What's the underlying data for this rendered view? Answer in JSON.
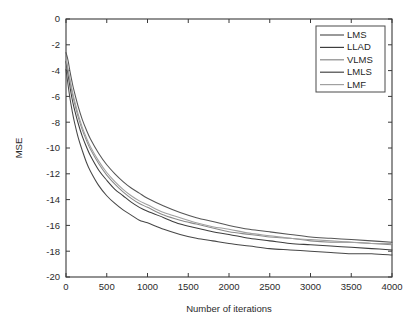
{
  "chart_data": {
    "type": "line",
    "title": "",
    "xlabel": "Number of iterations",
    "ylabel": "MSE",
    "xlim": [
      0,
      4000
    ],
    "ylim": [
      -20,
      0
    ],
    "grid": false,
    "legend_position": "top-right",
    "xticks": [
      0,
      500,
      1000,
      1500,
      2000,
      2500,
      3000,
      3500,
      4000
    ],
    "xtick_labels": [
      "0",
      "500",
      "1000",
      "1500",
      "2000",
      "2500",
      "3000",
      "3500",
      "4000"
    ],
    "yticks": [
      0,
      -2,
      -4,
      -6,
      -8,
      -10,
      -12,
      -14,
      -16,
      -18,
      -20
    ],
    "ytick_labels": [
      "0",
      "-2",
      "-4",
      "-6",
      "-8",
      "-10",
      "-12",
      "-14",
      "-16",
      "-18",
      "-20"
    ],
    "x": [
      0,
      25,
      50,
      75,
      100,
      150,
      200,
      250,
      300,
      400,
      500,
      600,
      700,
      800,
      900,
      1000,
      1200,
      1400,
      1600,
      1800,
      2000,
      2250,
      2500,
      2750,
      3000,
      3250,
      3500,
      3750,
      4000
    ],
    "series": [
      {
        "name": "LMS",
        "color": "#555555",
        "values": [
          -2.6,
          -3.2,
          -4.1,
          -4.9,
          -5.6,
          -6.8,
          -7.8,
          -8.6,
          -9.3,
          -10.4,
          -11.3,
          -12.0,
          -12.6,
          -13.1,
          -13.5,
          -13.9,
          -14.5,
          -15.0,
          -15.4,
          -15.7,
          -16.0,
          -16.3,
          -16.5,
          -16.7,
          -16.9,
          -17.0,
          -17.1,
          -17.2,
          -17.3
        ]
      },
      {
        "name": "LLAD",
        "color": "#3d3d3d",
        "values": [
          -3.3,
          -4.3,
          -5.3,
          -6.2,
          -6.9,
          -8.1,
          -9.1,
          -9.9,
          -10.6,
          -11.7,
          -12.5,
          -13.2,
          -13.7,
          -14.2,
          -14.6,
          -14.9,
          -15.4,
          -15.9,
          -16.2,
          -16.5,
          -16.7,
          -17.0,
          -17.2,
          -17.4,
          -17.5,
          -17.6,
          -17.7,
          -17.8,
          -17.9
        ]
      },
      {
        "name": "VLMS",
        "color": "#8a8a8a",
        "values": [
          -3.1,
          -4.0,
          -4.9,
          -5.7,
          -6.4,
          -7.6,
          -8.6,
          -9.4,
          -10.1,
          -11.2,
          -12.1,
          -12.8,
          -13.4,
          -13.9,
          -14.3,
          -14.6,
          -15.2,
          -15.6,
          -15.9,
          -16.2,
          -16.5,
          -16.7,
          -16.9,
          -17.0,
          -17.2,
          -17.3,
          -17.3,
          -17.4,
          -17.5
        ]
      },
      {
        "name": "LMLS",
        "color": "#474747",
        "values": [
          -3.9,
          -5.1,
          -6.2,
          -7.1,
          -7.9,
          -9.2,
          -10.2,
          -11.1,
          -11.8,
          -12.9,
          -13.7,
          -14.3,
          -14.8,
          -15.2,
          -15.6,
          -15.8,
          -16.3,
          -16.7,
          -17.0,
          -17.2,
          -17.4,
          -17.6,
          -17.8,
          -17.9,
          -18.0,
          -18.1,
          -18.2,
          -18.2,
          -18.3
        ]
      },
      {
        "name": "LMF",
        "color": "#a0a0a0",
        "values": [
          -3.0,
          -3.9,
          -4.7,
          -5.5,
          -6.2,
          -7.4,
          -8.4,
          -9.2,
          -9.9,
          -11.0,
          -11.9,
          -12.6,
          -13.2,
          -13.7,
          -14.1,
          -14.4,
          -15.0,
          -15.4,
          -15.8,
          -16.1,
          -16.3,
          -16.6,
          -16.8,
          -17.0,
          -17.1,
          -17.2,
          -17.3,
          -17.4,
          -17.4
        ]
      }
    ]
  },
  "legend": {
    "items": [
      {
        "label": "LMS"
      },
      {
        "label": "LLAD"
      },
      {
        "label": "VLMS"
      },
      {
        "label": "LMLS"
      },
      {
        "label": "LMF"
      }
    ]
  },
  "axes": {
    "x_title": "Number of iterations",
    "y_title": "MSE"
  }
}
